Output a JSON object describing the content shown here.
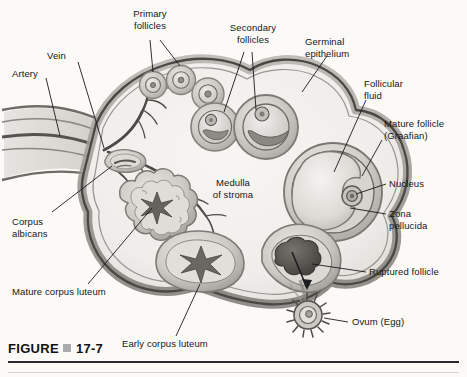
{
  "figure": {
    "caption_prefix": "FIGURE",
    "caption_number": "17-7",
    "separator_icon": "square-bullet-icon"
  },
  "labels": {
    "vein": "Vein",
    "artery": "Artery",
    "primary_follicles": "Primary\nfollicles",
    "secondary_follicles": "Secondary\nfollicles",
    "germinal_epithelium": "Germinal\nepithelium",
    "follicular_fluid": "Follicular\nfluid",
    "mature_follicle": "Mature follicle\n(Graafian)",
    "nucleus": "Nucleus",
    "zona_pellucida": "Zona\npellucida",
    "ruptured_follicle": "Ruptured follicle",
    "ovum": "Ovum (Egg)",
    "medulla": "Medulla\nof stroma",
    "corpus_albicans": "Corpus\nalbicans",
    "mature_corpus_luteum": "Mature corpus luteum",
    "early_corpus_luteum": "Early corpus luteum"
  },
  "colors": {
    "background": "#fbfaf7",
    "cortex_fill": "#f2f0ec",
    "capsule_outer": "#9d9a96",
    "capsule_line": "#55534f",
    "follicle_fill": "#cfcdc8",
    "follicle_edge": "#8d8a85",
    "vessel": "#4c4a47",
    "ruptured_dark": "#4f4d4a",
    "label_text": "#15151a",
    "leader_line": "#1a1a1d"
  },
  "diagram": {
    "structure_count": 15
  }
}
